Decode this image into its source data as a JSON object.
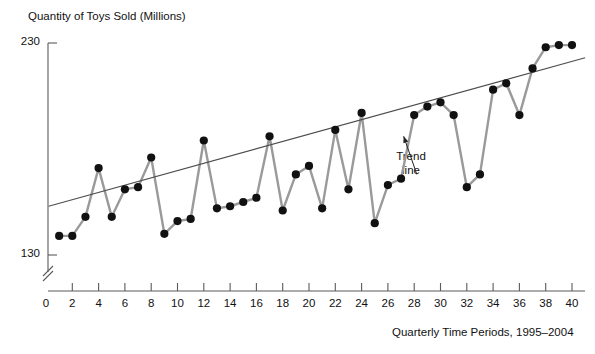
{
  "chart_data": {
    "type": "line",
    "title": "",
    "ylabel": "Quantity of Toys Sold (Millions)",
    "xlabel": "Quarterly Time  Periods, 1995–2004",
    "xlim": [
      0,
      41
    ],
    "ylim": [
      130,
      230
    ],
    "y_ticks": [
      130,
      230
    ],
    "y_tick_labels": [
      "130",
      "230"
    ],
    "x_ticks": [
      0,
      2,
      4,
      6,
      8,
      10,
      12,
      14,
      16,
      18,
      20,
      22,
      24,
      26,
      28,
      30,
      32,
      34,
      36,
      38,
      40
    ],
    "x_tick_labels": [
      "0",
      "2",
      "4",
      "6",
      "8",
      "10",
      "12",
      "14",
      "16",
      "18",
      "20",
      "22",
      "24",
      "26",
      "28",
      "30",
      "32",
      "34",
      "36",
      "38",
      "40"
    ],
    "grid": false,
    "legend": null,
    "axis_break_y": true,
    "series": [
      {
        "name": "Quantity of Toys Sold",
        "marker": "filled-circle",
        "color": "#9a9a9a",
        "marker_color": "#111111",
        "x": [
          1,
          2,
          3,
          4,
          5,
          6,
          7,
          8,
          9,
          10,
          11,
          12,
          13,
          14,
          15,
          16,
          17,
          18,
          19,
          20,
          21,
          22,
          23,
          24,
          25,
          26,
          27,
          28,
          29,
          30,
          31,
          32,
          33,
          34,
          35,
          36,
          37,
          38,
          39,
          40
        ],
        "values": [
          139,
          139,
          148,
          171,
          148,
          161,
          162,
          176,
          140,
          146,
          147,
          184,
          152,
          153,
          155,
          157,
          186,
          151,
          168,
          172,
          152,
          189,
          161,
          197,
          145,
          163,
          166,
          196,
          200,
          202,
          196,
          162,
          168,
          208,
          211,
          196,
          218,
          228,
          229,
          229
        ]
      }
    ],
    "trend_line": {
      "name": "Trend line",
      "color": "#4d4d4d",
      "x_start": 0.2,
      "x_end": 41,
      "y_start": 153,
      "y_end": 223
    },
    "annotations": [
      {
        "name": "trend-line-annotation",
        "text": "Trend\nline",
        "x": 28.2,
        "y": 168,
        "arrow_to_x": 27.2,
        "arrow_to_y": 186
      }
    ]
  },
  "axes": {
    "y_title": "Quantity of Toys Sold (Millions)",
    "x_title": "Quarterly Time  Periods, 1995–2004"
  },
  "colors": {
    "series_line": "#9a9a9a",
    "marker": "#111111",
    "trend_line": "#555555",
    "axis": "#5a5a5a",
    "text": "#111111",
    "background": "#ffffff"
  }
}
